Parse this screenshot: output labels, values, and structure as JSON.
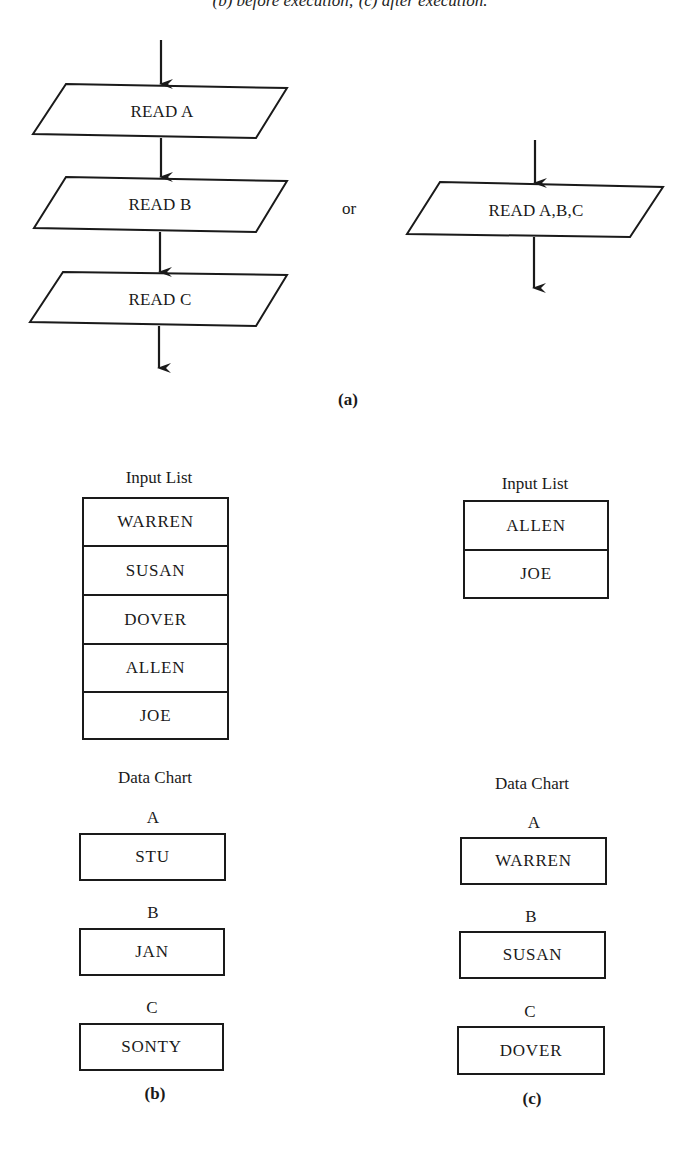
{
  "caption": {
    "top_text": "(b) before execution; (c) after execution."
  },
  "part_a": {
    "caption": "(a)",
    "separator": "or",
    "left_flow": {
      "steps": [
        "READ A",
        "READ B",
        "READ C"
      ]
    },
    "right_flow": {
      "steps": [
        "READ A,B,C"
      ]
    }
  },
  "part_b": {
    "caption": "(b)",
    "input_list": {
      "title": "Input List",
      "items": [
        "WARREN",
        "SUSAN",
        "DOVER",
        "ALLEN",
        "JOE"
      ]
    },
    "data_chart": {
      "title": "Data Chart",
      "variables": [
        {
          "name": "A",
          "value": "STU"
        },
        {
          "name": "B",
          "value": "JAN"
        },
        {
          "name": "C",
          "value": "SONTY"
        }
      ]
    }
  },
  "part_c": {
    "caption": "(c)",
    "input_list": {
      "title": "Input List",
      "items": [
        "ALLEN",
        "JOE"
      ]
    },
    "data_chart": {
      "title": "Data Chart",
      "variables": [
        {
          "name": "A",
          "value": "WARREN"
        },
        {
          "name": "B",
          "value": "SUSAN"
        },
        {
          "name": "C",
          "value": "DOVER"
        }
      ]
    }
  },
  "colors": {
    "ink": "#1a1a1a",
    "background": "#ffffff"
  }
}
